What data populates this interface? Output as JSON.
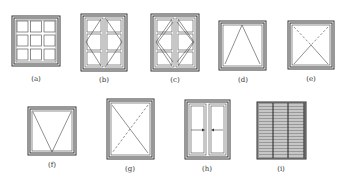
{
  "figure": {
    "items": [
      {
        "label": "(a)",
        "type": "fixed-grid-3x3"
      },
      {
        "label": "(b)",
        "type": "double-casement-side-hung"
      },
      {
        "label": "(c)",
        "type": "double-casement-side-hung-both"
      },
      {
        "label": "(d)",
        "type": "top-hung"
      },
      {
        "label": "(e)",
        "type": "tilt-turn"
      },
      {
        "label": "(f)",
        "type": "bottom-hung"
      },
      {
        "label": "(g)",
        "type": "pivot"
      },
      {
        "label": "(h)",
        "type": "sliding"
      },
      {
        "label": "(i)",
        "type": "louver"
      }
    ]
  },
  "colors": {
    "line": "#333333",
    "frame_fill": "#888888",
    "background": "#ffffff"
  }
}
